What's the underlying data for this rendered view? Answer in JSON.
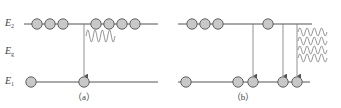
{
  "colors": {
    "line": "#555555",
    "circle_fill": "#c8c8c8",
    "circle_stroke": "#555555",
    "wave": "#777777",
    "text": "#444444"
  },
  "labels": {
    "upper_level": {
      "main": "E",
      "sub": "2"
    },
    "gap": {
      "main": "E",
      "sub": "g"
    },
    "lower_level": {
      "main": "E",
      "sub": "1"
    }
  },
  "panels": [
    {
      "id": "a",
      "caption": "（a）",
      "upper_line": {
        "x1": 24,
        "x2": 158,
        "y": 24
      },
      "lower_line": {
        "x1": 26,
        "x2": 158,
        "y": 82
      },
      "upper_electrons_x": [
        37,
        50,
        63,
        96,
        109,
        122,
        135
      ],
      "lower_electrons_x": [
        31,
        84
      ],
      "transitions_x": [
        84
      ],
      "photon_waves": [
        {
          "x": 86,
          "y": 36,
          "len": 29,
          "amp": 6,
          "periods": 4
        }
      ],
      "caption_x": 84
    },
    {
      "id": "b",
      "caption": "（b）",
      "upper_line": {
        "x1": 178,
        "x2": 312,
        "y": 24
      },
      "lower_line": {
        "x1": 178,
        "x2": 310,
        "y": 82
      },
      "upper_electrons_x": [
        192,
        205,
        218,
        268
      ],
      "lower_electrons_x": [
        186,
        238,
        253,
        283,
        297
      ],
      "transitions_x": [
        253,
        283,
        297
      ],
      "photon_waves": [
        {
          "x": 298,
          "y": 32,
          "len": 29,
          "amp": 4,
          "periods": 4
        },
        {
          "x": 298,
          "y": 41,
          "len": 29,
          "amp": 4,
          "periods": 4
        },
        {
          "x": 298,
          "y": 50,
          "len": 29,
          "amp": 4,
          "periods": 4
        },
        {
          "x": 298,
          "y": 58,
          "len": 29,
          "amp": 4,
          "periods": 4
        }
      ],
      "caption_x": 243
    }
  ]
}
